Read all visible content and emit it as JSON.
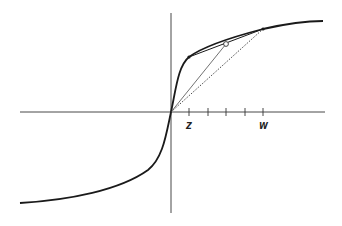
{
  "diagram": {
    "axes": {
      "origin": [
        171,
        112
      ],
      "x_axis": {
        "from": 20,
        "to": 325
      },
      "y_axis": {
        "from": 13,
        "to": 213
      },
      "ticks_x": [
        189,
        208,
        226,
        245,
        263
      ]
    },
    "labels": {
      "z": "Z",
      "w": "W"
    },
    "points": {
      "z_point": [
        189,
        57
      ],
      "mid_point": [
        226,
        44
      ],
      "w_point": [
        263,
        29
      ]
    },
    "colors": {
      "curve": "#1a1a1a",
      "axes": "#333333",
      "background": "#ffffff"
    }
  }
}
